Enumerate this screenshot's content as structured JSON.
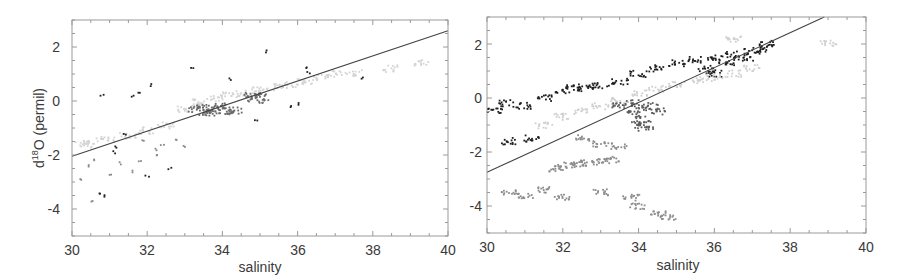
{
  "chart_data": [
    {
      "type": "scatter",
      "panel": "left",
      "title": "",
      "xlabel": "salinity",
      "ylabel": "d18O (permil)",
      "ylabel_parts": {
        "prefix": "d",
        "superscript": "18",
        "suffix": "O (permil)"
      },
      "xlim": [
        30,
        40
      ],
      "ylim": [
        -5,
        3
      ],
      "xticks": [
        30,
        32,
        34,
        36,
        38,
        40
      ],
      "yticks": [
        -4,
        -2,
        0,
        2
      ],
      "grid": false,
      "legend": null,
      "fit_line": {
        "x": [
          30,
          40
        ],
        "y": [
          -2.05,
          2.6
        ],
        "color": "#444444"
      },
      "series": [
        {
          "name": "light-grey dense band",
          "color": "#d4d4d4",
          "points": [
            [
              33.0,
              -0.3
            ],
            [
              33.4,
              -0.05
            ],
            [
              33.8,
              0.1
            ],
            [
              34.2,
              0.2
            ],
            [
              34.6,
              0.3
            ],
            [
              35.0,
              0.4
            ],
            [
              35.4,
              0.5
            ],
            [
              35.8,
              0.6
            ],
            [
              36.2,
              0.75
            ],
            [
              36.6,
              0.85
            ],
            [
              37.0,
              1.0
            ],
            [
              37.5,
              1.05
            ],
            [
              38.5,
              1.2
            ],
            [
              39.3,
              1.4
            ],
            [
              31.0,
              -1.4
            ],
            [
              31.5,
              -1.3
            ],
            [
              32.0,
              -1.1
            ],
            [
              32.5,
              -0.9
            ],
            [
              30.3,
              -1.6
            ],
            [
              30.5,
              -1.5
            ]
          ]
        },
        {
          "name": "dark-grey cluster",
          "color": "#6a6a6a",
          "points": [
            [
              33.3,
              -0.3
            ],
            [
              33.5,
              -0.25
            ],
            [
              33.7,
              -0.35
            ],
            [
              33.9,
              -0.3
            ],
            [
              34.1,
              -0.4
            ],
            [
              34.3,
              -0.35
            ],
            [
              33.6,
              -0.45
            ],
            [
              34.0,
              -0.2
            ],
            [
              34.8,
              0.2
            ],
            [
              35.0,
              0.15
            ],
            [
              34.9,
              0.05
            ]
          ]
        },
        {
          "name": "scattered black points",
          "color": "#222222",
          "points": [
            [
              35.2,
              1.85
            ],
            [
              33.2,
              1.2
            ],
            [
              34.2,
              0.8
            ],
            [
              36.2,
              1.2
            ],
            [
              36.3,
              1.05
            ],
            [
              31.8,
              0.3
            ],
            [
              31.6,
              0.2
            ],
            [
              32.1,
              0.6
            ],
            [
              30.8,
              0.2
            ],
            [
              30.9,
              -3.5
            ],
            [
              30.7,
              -3.4
            ],
            [
              31.2,
              -1.7
            ],
            [
              31.4,
              -1.25
            ],
            [
              31.1,
              -1.9
            ],
            [
              32.0,
              -2.8
            ],
            [
              32.6,
              -2.5
            ],
            [
              37.7,
              0.85
            ],
            [
              35.8,
              -0.2
            ],
            [
              36.0,
              -0.1
            ],
            [
              34.9,
              -0.7
            ]
          ]
        },
        {
          "name": "scattered mid-grey points",
          "color": "#8a8a8a",
          "points": [
            [
              30.4,
              -2.4
            ],
            [
              30.6,
              -2.2
            ],
            [
              31.0,
              -2.7
            ],
            [
              31.3,
              -2.3
            ],
            [
              31.6,
              -2.6
            ],
            [
              31.8,
              -2.2
            ],
            [
              32.3,
              -2.0
            ],
            [
              32.4,
              -1.6
            ],
            [
              32.8,
              -1.4
            ],
            [
              33.0,
              -1.7
            ],
            [
              31.9,
              -1.5
            ],
            [
              32.2,
              -1.8
            ],
            [
              30.5,
              -3.7
            ],
            [
              30.2,
              -2.9
            ]
          ]
        }
      ]
    },
    {
      "type": "scatter",
      "panel": "right",
      "title": "",
      "xlabel": "salinity",
      "ylabel": "",
      "xlim": [
        30,
        40
      ],
      "ylim": [
        -5,
        3
      ],
      "xticks": [
        30,
        32,
        34,
        36,
        38,
        40
      ],
      "yticks": [
        -4,
        -2,
        0,
        2
      ],
      "grid": false,
      "legend": null,
      "fit_line": {
        "x": [
          30,
          38.9
        ],
        "y": [
          -2.75,
          3.0
        ],
        "color": "#444444"
      },
      "series": [
        {
          "name": "black upper band",
          "color": "#1e1e1e",
          "points": [
            [
              32.0,
              0.3
            ],
            [
              32.3,
              0.4
            ],
            [
              32.6,
              0.35
            ],
            [
              33.0,
              0.45
            ],
            [
              33.5,
              0.6
            ],
            [
              34.0,
              0.9
            ],
            [
              34.5,
              1.1
            ],
            [
              35.0,
              1.3
            ],
            [
              35.5,
              1.4
            ],
            [
              36.0,
              1.5
            ],
            [
              36.3,
              1.3
            ],
            [
              36.5,
              1.6
            ],
            [
              36.8,
              1.5
            ],
            [
              37.0,
              1.75
            ],
            [
              37.2,
              1.8
            ],
            [
              37.4,
              2.0
            ],
            [
              36.0,
              0.9
            ],
            [
              35.8,
              1.1
            ],
            [
              30.2,
              -0.5
            ],
            [
              30.5,
              -0.2
            ],
            [
              31.0,
              -0.3
            ],
            [
              31.5,
              0.0
            ],
            [
              30.6,
              -1.6
            ],
            [
              31.2,
              -1.5
            ]
          ]
        },
        {
          "name": "light-grey band",
          "color": "#cfcfcf",
          "points": [
            [
              32.5,
              -0.5
            ],
            [
              33.0,
              -0.3
            ],
            [
              33.5,
              -0.1
            ],
            [
              34.0,
              0.2
            ],
            [
              34.5,
              0.35
            ],
            [
              35.0,
              0.5
            ],
            [
              35.5,
              0.65
            ],
            [
              36.0,
              0.75
            ],
            [
              36.5,
              0.9
            ],
            [
              37.0,
              1.1
            ],
            [
              31.5,
              -1.0
            ],
            [
              32.0,
              -0.7
            ],
            [
              39.0,
              2.0
            ],
            [
              36.5,
              2.2
            ]
          ]
        },
        {
          "name": "dark-grey cluster",
          "color": "#5c5c5c",
          "points": [
            [
              33.5,
              -0.3
            ],
            [
              33.8,
              -0.2
            ],
            [
              34.0,
              -0.4
            ],
            [
              34.3,
              -0.3
            ],
            [
              34.5,
              -0.5
            ],
            [
              34.1,
              -0.8
            ],
            [
              34.0,
              -1.0
            ],
            [
              34.2,
              -1.1
            ],
            [
              33.9,
              -0.6
            ]
          ]
        },
        {
          "name": "mid-grey lower band",
          "color": "#8c8c8c",
          "points": [
            [
              31.8,
              -2.6
            ],
            [
              32.1,
              -2.5
            ],
            [
              32.4,
              -2.45
            ],
            [
              32.7,
              -2.4
            ],
            [
              33.0,
              -2.35
            ],
            [
              33.3,
              -2.3
            ],
            [
              31.0,
              -3.6
            ],
            [
              30.6,
              -3.5
            ],
            [
              31.5,
              -3.4
            ],
            [
              32.0,
              -3.7
            ],
            [
              33.0,
              -3.5
            ],
            [
              33.8,
              -3.7
            ],
            [
              34.0,
              -4.0
            ],
            [
              34.5,
              -4.3
            ],
            [
              34.8,
              -4.4
            ],
            [
              32.5,
              -1.5
            ],
            [
              33.0,
              -1.7
            ],
            [
              33.5,
              -1.8
            ]
          ]
        }
      ]
    }
  ],
  "panels": {
    "left": {
      "xlabel": "salinity",
      "ylabel_prefix": "d",
      "ylabel_sup": "18",
      "ylabel_suffix": "O (permil)",
      "xtick_labels": [
        "30",
        "32",
        "34",
        "36",
        "38",
        "40"
      ],
      "ytick_labels": [
        "2",
        "0",
        "-2",
        "-4"
      ]
    },
    "right": {
      "xlabel": "salinity",
      "xtick_labels": [
        "30",
        "32",
        "34",
        "36",
        "38",
        "40"
      ],
      "ytick_labels": [
        "2",
        "0",
        "-2",
        "-4"
      ]
    }
  }
}
